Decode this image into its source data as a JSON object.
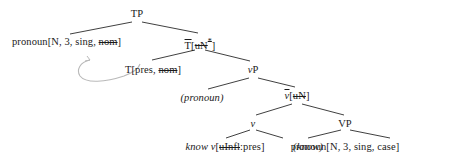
{
  "figure": {
    "kind": "syntax-tree"
  },
  "nodes": {
    "tp": {
      "label": "TP",
      "x": 137,
      "y": 8
    },
    "subject_spec": {
      "prefix": "pronoun[N, 3, sing, ",
      "struck": "nom",
      "suffix": "]",
      "x": 12,
      "y": 36
    },
    "t_bar": {
      "prefix": "T",
      "open": "[",
      "struck": "uN",
      "star": "*",
      "close": "]",
      "x": 200,
      "y": 36
    },
    "t_head": {
      "prefix": "T[pres, ",
      "struck": "nom",
      "suffix": "]",
      "x": 153,
      "y": 64
    },
    "vp_small": {
      "prefix": "v",
      "suffix": "P",
      "x": 253,
      "y": 64
    },
    "pronoun_trace": {
      "text": "(pronoun)",
      "x": 202,
      "y": 92
    },
    "v_bar": {
      "prefix": "v",
      "open": "[",
      "struck": "uN",
      "close": "]",
      "x": 297,
      "y": 90
    },
    "v_head": {
      "label": "v",
      "x": 253,
      "y": 118
    },
    "vp_big": {
      "label": "VP",
      "x": 345,
      "y": 118
    },
    "know_v": {
      "word": "know ",
      "vlabel": "v",
      "open": "[",
      "struck": "uInfl",
      "value": ":pres",
      "close": "]",
      "x": 225,
      "y": 141
    },
    "know_trace": {
      "text": "(know)",
      "x": 308,
      "y": 141
    },
    "object": {
      "text": "pronoun[N, 3, sing, case]",
      "x": 345,
      "y": 141
    }
  },
  "edges": [
    {
      "name": "tp-to-subject",
      "from": "TP",
      "to": "pronoun[N, 3, sing, nom]"
    },
    {
      "name": "tp-to-tbar",
      "from": "TP",
      "to": "T[uN*]"
    },
    {
      "name": "tbar-to-thead",
      "from": "T[uN*]",
      "to": "T[pres, nom]"
    },
    {
      "name": "tbar-to-vp",
      "from": "T[uN*]",
      "to": "vP"
    },
    {
      "name": "vp-to-pronoun-trace",
      "from": "vP",
      "to": "(pronoun)"
    },
    {
      "name": "vp-to-vbar",
      "from": "vP",
      "to": "v-bar[uN]"
    },
    {
      "name": "vbar-to-v",
      "from": "v-bar[uN]",
      "to": "v"
    },
    {
      "name": "vbar-to-VP",
      "from": "v-bar[uN]",
      "to": "VP"
    },
    {
      "name": "v-to-know",
      "from": "v",
      "to": "know v[uInfl:pres]"
    },
    {
      "name": "VP-to-know-trace",
      "from": "VP",
      "to": "(know)"
    },
    {
      "name": "VP-to-object",
      "from": "VP",
      "to": "pronoun[N, 3, sing, case]"
    }
  ],
  "movement_arrow": {
    "name": "head-movement-arrow",
    "description": "curved arrow from T head leftward and upward",
    "color": "#b9b9b9"
  },
  "colors": {
    "text": "#1a1a1a",
    "line": "#2a2a2a",
    "arrow": "#b9b9b9",
    "background": "#ffffff"
  }
}
